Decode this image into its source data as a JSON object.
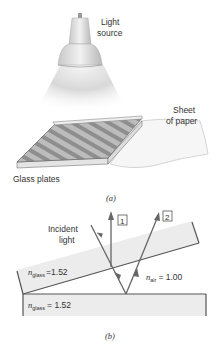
{
  "figure": {
    "part_a": {
      "caption": "(a)",
      "labels": {
        "light_source_line1": "Light",
        "light_source_line2": "source",
        "paper_line1": "Sheet",
        "paper_line2": "of paper",
        "glass_plates": "Glass plates"
      }
    },
    "part_b": {
      "caption": "(b)",
      "incident_line1": "Incident",
      "incident_line2": "light",
      "ray1_label": "1",
      "ray2_label": "2",
      "top_glass": {
        "symbol": "n",
        "subscript": "glass",
        "value": "=1.52"
      },
      "air": {
        "symbol": "n",
        "subscript": "air",
        "value": "= 1.00"
      },
      "bottom_glass": {
        "symbol": "n",
        "subscript": "glass",
        "value": "= 1.52"
      }
    },
    "colors": {
      "line": "#555555",
      "glass_fill": "#ebebeb",
      "text": "#333333"
    }
  }
}
